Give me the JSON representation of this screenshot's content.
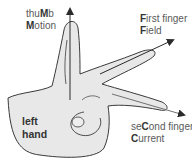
{
  "diagram": {
    "thumb": {
      "line1_pre": "thu",
      "line1_bold": "M",
      "line1_post": "b",
      "line2_bold": "M",
      "line2_post": "otion"
    },
    "first": {
      "line1_bold": "F",
      "line1_post": "irst finger",
      "line2_bold": "F",
      "line2_post": "ield"
    },
    "second": {
      "line1_pre": "se",
      "line1_bold": "C",
      "line1_post": "ond finger",
      "line2_bold": "C",
      "line2_post": "urrent"
    },
    "hand_label_1": "left",
    "hand_label_2": "hand",
    "colors": {
      "hand_fill": "#e8e8e8",
      "outline": "#3a3a3a",
      "arrow": "#222222"
    }
  }
}
